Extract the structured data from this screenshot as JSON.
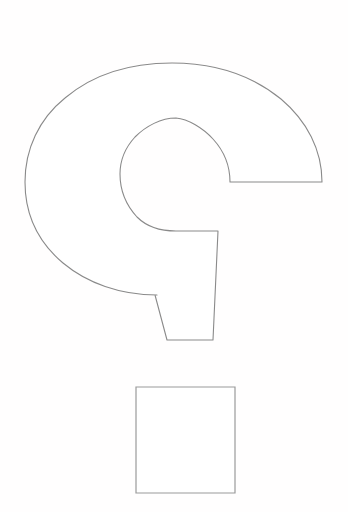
{
  "document": {
    "title": "Question Mark Outline",
    "type": "line-art-coloring-page",
    "width": 348,
    "height": 512,
    "background_color": "#fffefe"
  },
  "style": {
    "stroke_color": "#8a8a8a",
    "square_stroke_color": "#9a9a9a",
    "fill_color": "#ffffff",
    "stroke_width": 1.1
  },
  "shapes": [
    {
      "name": "question-mark-body",
      "description": "Large hook/arc forming the upper curve and tapered tail of a question mark",
      "outer_arc": {
        "center_x": 174,
        "center_y": 182,
        "radius_x": 149,
        "radius_y": 134,
        "top_y": 48,
        "left_x": 25,
        "right_x": 322,
        "bottom_y": 294
      },
      "inner_hole": {
        "center_x": 176,
        "center_y": 174,
        "radius": 56,
        "top_y": 118,
        "left_x": 120,
        "right_x": 230,
        "bottom_y": 230
      },
      "right_ledge_line": {
        "y": 182,
        "x_start": 230,
        "x_end": 322
      },
      "tail": {
        "top_right_x": 218,
        "top_right_y": 231,
        "bottom_right_x": 213,
        "bottom_right_y": 340,
        "bottom_left_x": 167,
        "bottom_left_y": 340,
        "notch_x": 155,
        "notch_y": 295
      }
    },
    {
      "name": "question-mark-dot",
      "description": "Square forming the dot of the question mark",
      "left_x": 136,
      "top_y": 387,
      "right_x": 235,
      "bottom_y": 493,
      "width": 99,
      "height": 106
    }
  ],
  "paths": {
    "body_d": "M 155,295 L 157,295 C 120,295 87,283 63,263 C 38,242 25,214 25,182 C 25,149 39,119 65,98 C 91,76 127,63 172,63 C 217,63 254,77 281,99 C 307,121 322,150 322,182 L 322,182 L 230,182 L 230,182 C 230,166 224,151 213,139 C 203,128 188,119 176,118 C 161,118 146,126 135,137 C 124,149 120,162 120,174 C 120,190 126,205 137,217 C 148,228 163,231 176,231 L 218,231 L 213,340 L 167,340 Z",
    "square_d": "M 136,387 L 235,387 L 235,493 L 136,493 Z"
  }
}
